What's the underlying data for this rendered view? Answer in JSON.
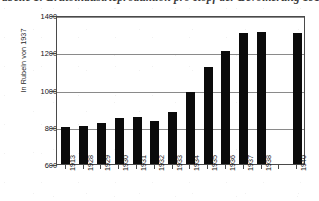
{
  "caption": {
    "text": "abelle 1:  Brutoindustrieproduktion pro Kopf der Bevölkerung 1913–1940"
  },
  "chart_data": {
    "type": "bar",
    "title": "",
    "xlabel": "",
    "ylabel": "In Rubeln von 1937",
    "categories": [
      "1913",
      "1928",
      "1929",
      "1930",
      "1931",
      "1932",
      "1933",
      "1934",
      "1935",
      "1936",
      "1937",
      "1938",
      "",
      "1940"
    ],
    "values": [
      800,
      805,
      820,
      845,
      850,
      830,
      880,
      985,
      1120,
      1205,
      1305,
      1310,
      null,
      1305
    ],
    "ylim": [
      600,
      1400
    ],
    "yticks": [
      600,
      800,
      1000,
      1200,
      1400
    ],
    "ytick_labels": [
      "600",
      "800",
      "1000",
      "1200",
      "1400"
    ],
    "gridlines": true,
    "grid_axis": "y",
    "legend": null,
    "bar_color": "#0b0b0b",
    "axis_color": "#4a4a4a",
    "grid_color": "#8a8a8a"
  }
}
